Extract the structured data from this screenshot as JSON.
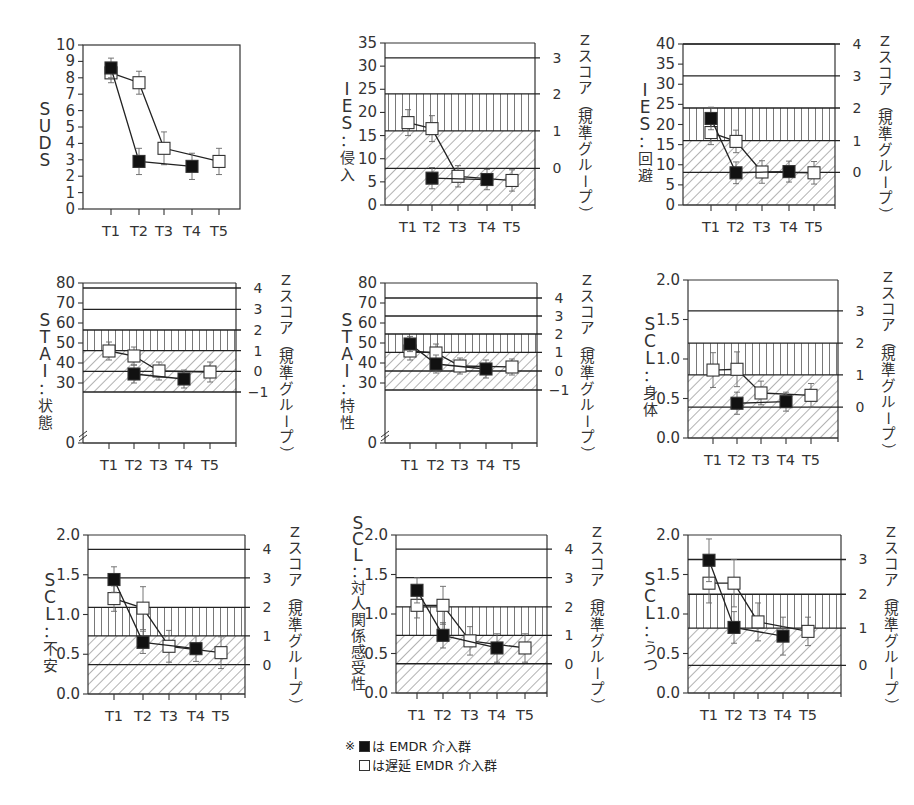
{
  "legend": {
    "note_mark": "※",
    "items": [
      {
        "symbol": "filled-square",
        "label": "は EMDR 介入群"
      },
      {
        "symbol": "open-square",
        "label": "は遅延 EMDR 介入群"
      }
    ]
  },
  "chart_data": [
    {
      "id": "suds",
      "type": "line",
      "ylabel": "SUDS",
      "categories": [
        "T1",
        "T2",
        "T3",
        "T4",
        "T5"
      ],
      "ylim": [
        0,
        10
      ],
      "yticks": [
        0,
        1,
        2,
        3,
        4,
        5,
        6,
        7,
        8,
        9,
        10
      ],
      "zscore_axis": null,
      "bands": null,
      "box": {
        "x": 83,
        "y": 45,
        "w": 157,
        "h": 164
      },
      "x_positions": [
        111,
        139,
        164,
        192,
        219
      ],
      "series": [
        {
          "name": "EMDR 介入群",
          "marker": "filled-square",
          "values": [
            8.6,
            2.9,
            null,
            2.6,
            null
          ],
          "err": [
            0.6,
            0.8,
            null,
            0.8,
            null
          ]
        },
        {
          "name": "遅延 EMDR 介入群",
          "marker": "open-square",
          "values": [
            8.3,
            7.7,
            3.7,
            null,
            2.9
          ],
          "err": [
            0.6,
            0.7,
            1.0,
            null,
            0.8
          ]
        }
      ]
    },
    {
      "id": "ies-intrusion",
      "type": "line",
      "ylabel": "IES：侵入",
      "categories": [
        "T1",
        "T2",
        "T3",
        "T4",
        "T5"
      ],
      "ylim": [
        0,
        35
      ],
      "yticks": [
        0,
        5,
        10,
        15,
        20,
        25,
        30,
        35
      ],
      "zscore_axis": {
        "label": "Zスコア（規準グループ）",
        "ticks": [
          {
            "z": 0,
            "y": 7.9
          },
          {
            "z": 1,
            "y": 16
          },
          {
            "z": 2,
            "y": 24
          },
          {
            "z": 3,
            "y": 31.8
          }
        ]
      },
      "bands": {
        "vertical_hatch": [
          16,
          24
        ],
        "diagonal_hatch": [
          0,
          16
        ]
      },
      "box": {
        "x": 385,
        "y": 43,
        "w": 150,
        "h": 162
      },
      "x_positions": [
        408,
        432,
        458,
        487,
        512
      ],
      "series": [
        {
          "name": "EMDR 介入群",
          "marker": "filled-square",
          "values": [
            null,
            5.8,
            null,
            5.5,
            null
          ],
          "err": [
            null,
            2.3,
            null,
            2.2,
            null
          ]
        },
        {
          "name": "遅延 EMDR 介入群",
          "marker": "open-square",
          "values": [
            17.8,
            16.5,
            6.2,
            null,
            5.3
          ],
          "err": [
            2.8,
            2.8,
            2.3,
            null,
            2.3
          ]
        }
      ]
    },
    {
      "id": "ies-avoidance",
      "type": "line",
      "ylabel": "IES：回避",
      "categories": [
        "T1",
        "T2",
        "T3",
        "T4",
        "T5"
      ],
      "ylim": [
        0,
        40
      ],
      "yticks": [
        0,
        5,
        10,
        15,
        20,
        25,
        30,
        35,
        40
      ],
      "zscore_axis": {
        "label": "Zスコア（規準グループ）",
        "ticks": [
          {
            "z": 0,
            "y": 8.1
          },
          {
            "z": 1,
            "y": 16
          },
          {
            "z": 2,
            "y": 24.1
          },
          {
            "z": 3,
            "y": 32.1
          },
          {
            "z": 4,
            "y": 40
          }
        ]
      },
      "bands": {
        "vertical_hatch": [
          16,
          24.1
        ],
        "diagonal_hatch": [
          0,
          16
        ]
      },
      "box": {
        "x": 683,
        "y": 44,
        "w": 152,
        "h": 161
      },
      "x_positions": [
        711,
        736,
        762,
        789,
        814
      ],
      "series": [
        {
          "name": "EMDR 介入群",
          "marker": "filled-square",
          "values": [
            21.5,
            8,
            null,
            8.3,
            null
          ],
          "err": [
            2.8,
            2.7,
            null,
            2.6,
            null
          ]
        },
        {
          "name": "遅延 EMDR 介入群",
          "marker": "open-square",
          "values": [
            18,
            15.8,
            8.2,
            null,
            8
          ],
          "err": [
            3,
            2.8,
            2.8,
            null,
            2.8
          ]
        }
      ]
    },
    {
      "id": "stai-state",
      "type": "line",
      "ylabel": "STAI：状態",
      "categories": [
        "T1",
        "T2",
        "T3",
        "T4",
        "T5"
      ],
      "ylim": [
        0,
        80
      ],
      "yticks": [
        0,
        30,
        40,
        50,
        60,
        70,
        80
      ],
      "axis_break": true,
      "zscore_axis": {
        "label": "Zスコア（規準グループ）",
        "ticks": [
          {
            "z": -1,
            "y": 25.5
          },
          {
            "z": 0,
            "y": 35.8
          },
          {
            "z": 1,
            "y": 46.2
          },
          {
            "z": 2,
            "y": 56.5
          },
          {
            "z": 3,
            "y": 66.8
          },
          {
            "z": 4,
            "y": 77.5
          }
        ]
      },
      "bands": {
        "vertical_hatch": [
          46.2,
          56.5
        ],
        "diagonal_hatch": [
          25.5,
          46.2
        ]
      },
      "box": {
        "x": 83,
        "y": 283,
        "w": 153,
        "h": 160
      },
      "x_positions": [
        109,
        134,
        159,
        184,
        210
      ],
      "series": [
        {
          "name": "EMDR 介入群",
          "marker": "filled-square",
          "values": [
            null,
            34.5,
            null,
            32,
            null
          ],
          "err": [
            null,
            4.5,
            null,
            4.5,
            null
          ]
        },
        {
          "name": "遅延 EMDR 介入群",
          "marker": "open-square",
          "values": [
            46,
            43.5,
            36,
            null,
            35.5
          ],
          "err": [
            4.5,
            4.5,
            4.5,
            null,
            5
          ]
        }
      ]
    },
    {
      "id": "stai-trait",
      "type": "line",
      "ylabel": "STAI：特性",
      "categories": [
        "T1",
        "T2",
        "T3",
        "T4",
        "T5"
      ],
      "ylim": [
        0,
        80
      ],
      "yticks": [
        0,
        30,
        40,
        50,
        60,
        70,
        80
      ],
      "axis_break": true,
      "zscore_axis": {
        "label": "Zスコア（規準グループ）",
        "ticks": [
          {
            "z": -1,
            "y": 26.5
          },
          {
            "z": 0,
            "y": 36
          },
          {
            "z": 1,
            "y": 45.3
          },
          {
            "z": 2,
            "y": 54.5
          },
          {
            "z": 3,
            "y": 63.5
          },
          {
            "z": 4,
            "y": 72.5
          }
        ]
      },
      "bands": {
        "vertical_hatch": [
          45.3,
          54.5
        ],
        "diagonal_hatch": [
          26.5,
          45.3
        ]
      },
      "box": {
        "x": 385,
        "y": 283,
        "w": 152,
        "h": 160
      },
      "x_positions": [
        410,
        436,
        460,
        486,
        512
      ],
      "series": [
        {
          "name": "EMDR 介入群",
          "marker": "filled-square",
          "values": [
            49.5,
            39.5,
            null,
            37,
            null
          ],
          "err": [
            3.8,
            4.5,
            null,
            4.5,
            null
          ]
        },
        {
          "name": "遅延 EMDR 介入群",
          "marker": "open-square",
          "values": [
            46,
            45,
            38.5,
            null,
            38
          ],
          "err": [
            4.5,
            4.5,
            4,
            null,
            4
          ]
        }
      ]
    },
    {
      "id": "scl-somatic",
      "type": "line",
      "ylabel": "SCL：身体",
      "categories": [
        "T1",
        "T2",
        "T3",
        "T4",
        "T5"
      ],
      "ylim": [
        0,
        2
      ],
      "yticks": [
        "0.0",
        "0.5",
        "1.0",
        "1.5",
        "2.0"
      ],
      "zscore_axis": {
        "label": "Zスコア（規準グループ）",
        "ticks": [
          {
            "z": 0,
            "y": 0.39
          },
          {
            "z": 1,
            "y": 0.8
          },
          {
            "z": 2,
            "y": 1.2
          },
          {
            "z": 3,
            "y": 1.61
          }
        ]
      },
      "bands": {
        "vertical_hatch": [
          0.8,
          1.2
        ],
        "diagonal_hatch": [
          0,
          0.8
        ]
      },
      "box": {
        "x": 688,
        "y": 280,
        "w": 150,
        "h": 158
      },
      "x_positions": [
        713,
        737,
        761,
        786,
        811
      ],
      "series": [
        {
          "name": "EMDR 介入群",
          "marker": "filled-square",
          "values": [
            null,
            0.44,
            null,
            0.46,
            null
          ],
          "err": [
            null,
            0.14,
            null,
            0.12,
            null
          ]
        },
        {
          "name": "遅延 EMDR 介入群",
          "marker": "open-square",
          "values": [
            0.86,
            0.87,
            0.57,
            null,
            0.54
          ],
          "err": [
            0.22,
            0.22,
            0.15,
            null,
            0.15
          ]
        }
      ]
    },
    {
      "id": "scl-anxiety",
      "type": "line",
      "ylabel": "SCL：不安",
      "categories": [
        "T1",
        "T2",
        "T3",
        "T4",
        "T5"
      ],
      "ylim": [
        0,
        2
      ],
      "yticks": [
        "0.0",
        "0.5",
        "1.0",
        "1.5",
        "2.0"
      ],
      "zscore_axis": {
        "label": "Zスコア（規準グループ）",
        "ticks": [
          {
            "z": 0,
            "y": 0.37
          },
          {
            "z": 1,
            "y": 0.73
          },
          {
            "z": 2,
            "y": 1.09
          },
          {
            "z": 3,
            "y": 1.46
          },
          {
            "z": 4,
            "y": 1.82
          }
        ]
      },
      "bands": {
        "vertical_hatch": [
          0.73,
          1.09
        ],
        "diagonal_hatch": [
          0,
          0.73
        ]
      },
      "box": {
        "x": 88,
        "y": 535,
        "w": 157,
        "h": 159
      },
      "x_positions": [
        114,
        143,
        169,
        196,
        221
      ],
      "series": [
        {
          "name": "EMDR 介入群",
          "marker": "filled-square",
          "values": [
            1.44,
            0.65,
            null,
            0.57,
            null
          ],
          "err": [
            0.16,
            0.14,
            null,
            0.16,
            null
          ]
        },
        {
          "name": "遅延 EMDR 介入群",
          "marker": "open-square",
          "values": [
            1.2,
            1.08,
            0.6,
            null,
            0.52
          ],
          "err": [
            0.16,
            0.27,
            0.2,
            null,
            0.2
          ]
        }
      ]
    },
    {
      "id": "scl-interpersonal",
      "type": "line",
      "ylabel": "SCL：対人関係感受性",
      "categories": [
        "T1",
        "T2",
        "T3",
        "T4",
        "T5"
      ],
      "ylim": [
        0,
        2
      ],
      "yticks": [
        "0.0",
        "0.5",
        "1.0",
        "1.5",
        "2.0"
      ],
      "zscore_axis": {
        "label": "Zスコア（規準グループ）",
        "ticks": [
          {
            "z": 0,
            "y": 0.37
          },
          {
            "z": 1,
            "y": 0.73
          },
          {
            "z": 2,
            "y": 1.09
          },
          {
            "z": 3,
            "y": 1.46
          },
          {
            "z": 4,
            "y": 1.82
          }
        ]
      },
      "bands": {
        "vertical_hatch": [
          0.73,
          1.09
        ],
        "diagonal_hatch": [
          0,
          0.73
        ]
      },
      "box": {
        "x": 396,
        "y": 535,
        "w": 151,
        "h": 158
      },
      "x_positions": [
        417,
        443,
        470,
        497,
        525
      ],
      "series": [
        {
          "name": "EMDR 介入群",
          "marker": "filled-square",
          "values": [
            1.3,
            0.73,
            null,
            0.57,
            null
          ],
          "err": [
            0.16,
            0.16,
            null,
            0.18,
            null
          ]
        },
        {
          "name": "遅延 EMDR 介入群",
          "marker": "open-square",
          "values": [
            1.11,
            1.11,
            0.66,
            null,
            0.57
          ],
          "err": [
            0.16,
            0.24,
            0.18,
            null,
            0.18
          ]
        }
      ]
    },
    {
      "id": "scl-depression",
      "type": "line",
      "ylabel": "SCL：うつ",
      "categories": [
        "T1",
        "T2",
        "T3",
        "T4",
        "T5"
      ],
      "ylim": [
        0,
        2
      ],
      "yticks": [
        "0.0",
        "0.5",
        "1.0",
        "1.5",
        "2.0"
      ],
      "zscore_axis": {
        "label": "Zスコア（規準グループ）",
        "ticks": [
          {
            "z": 0,
            "y": 0.35
          },
          {
            "z": 1,
            "y": 0.82
          },
          {
            "z": 2,
            "y": 1.25
          },
          {
            "z": 3,
            "y": 1.69
          }
        ]
      },
      "bands": {
        "vertical_hatch": [
          0.82,
          1.25
        ],
        "diagonal_hatch": [
          0,
          0.82
        ]
      },
      "box": {
        "x": 688,
        "y": 535,
        "w": 153,
        "h": 158
      },
      "x_positions": [
        709,
        734,
        758,
        783,
        808
      ],
      "series": [
        {
          "name": "EMDR 介入群",
          "marker": "filled-square",
          "values": [
            1.68,
            0.83,
            null,
            0.72,
            null
          ],
          "err": [
            0.27,
            0.2,
            null,
            0.24,
            null
          ]
        },
        {
          "name": "遅延 EMDR 介入群",
          "marker": "open-square",
          "values": [
            1.39,
            1.39,
            0.9,
            null,
            0.78
          ],
          "err": [
            0.25,
            0.3,
            0.24,
            null,
            0.18
          ]
        }
      ]
    }
  ]
}
